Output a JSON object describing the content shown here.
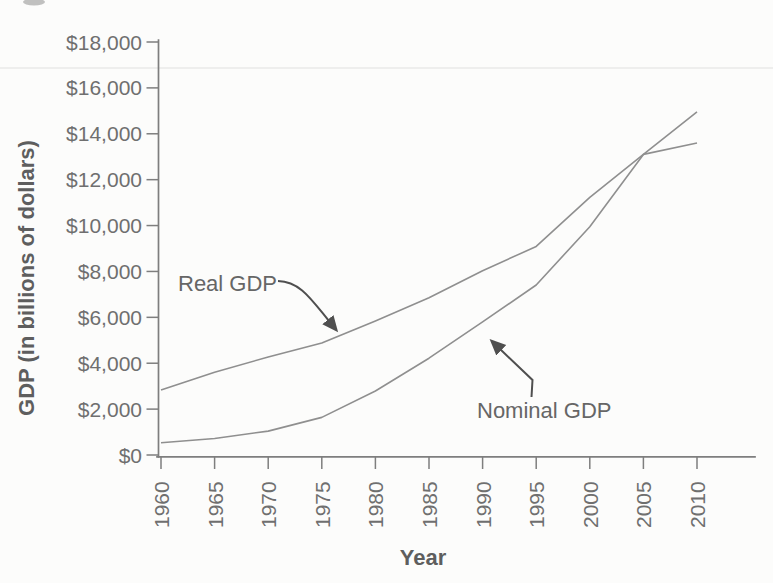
{
  "figure": {
    "y_axis_title": "GDP (in billions of dollars)",
    "x_axis_title": "Year",
    "annotations": {
      "real_label": "Real GDP",
      "nominal_label": "Nominal GDP"
    }
  },
  "chart_data": {
    "type": "line",
    "title": "",
    "xlabel": "Year",
    "ylabel": "GDP (in billions of dollars)",
    "x": [
      1960,
      1965,
      1970,
      1975,
      1980,
      1985,
      1990,
      1995,
      2000,
      2005,
      2010
    ],
    "x_tick_labels": [
      "1960",
      "1965",
      "1970",
      "1975",
      "1980",
      "1985",
      "1990",
      "1995",
      "2000",
      "2005",
      "2010"
    ],
    "xlim": [
      1960,
      2015.5
    ],
    "ylim": [
      0,
      18000
    ],
    "y_ticks": [
      0,
      2000,
      4000,
      6000,
      8000,
      10000,
      12000,
      14000,
      16000,
      18000
    ],
    "y_tick_labels": [
      "$0",
      "$2,000",
      "$4,000",
      "$6,000",
      "$8,000",
      "$10,000",
      "$12,000",
      "$14,000",
      "$16,000",
      "$18,000"
    ],
    "grid": false,
    "legend_position": "inline arrow annotations",
    "series": [
      {
        "name": "Real GDP",
        "values": [
          2830,
          3610,
          4270,
          4880,
          5840,
          6850,
          8030,
          9090,
          11230,
          13100,
          13600
        ]
      },
      {
        "name": "Nominal GDP",
        "values": [
          530,
          720,
          1040,
          1640,
          2790,
          4220,
          5800,
          7410,
          9950,
          13100,
          14960
        ]
      }
    ],
    "annotations": [
      {
        "text": "Real GDP",
        "points_to": {
          "x": 1976,
          "y": 5400
        }
      },
      {
        "text": "Nominal GDP",
        "points_to": {
          "x": 1991,
          "y": 5300
        }
      }
    ]
  },
  "style": {
    "background": "#fcfcfb",
    "line_color": "#8f8f8f",
    "axis_color": "#7e7e7e",
    "tick_label_color": "#6f6f6f",
    "axis_title_color": "#5e5e5e",
    "annotation_color": "#666666",
    "arrow_color": "#4f4f4f"
  }
}
